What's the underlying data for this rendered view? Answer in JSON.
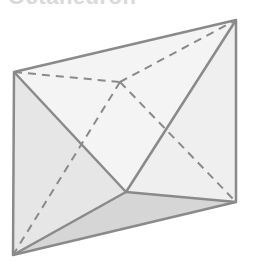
{
  "title": "Octahedron",
  "figure": {
    "shape": "octahedron",
    "vertices": {
      "top_left": [
        14,
        72
      ],
      "top_right": [
        236,
        20
      ],
      "bottom_right": [
        236,
        202
      ],
      "bottom_left": [
        13,
        255
      ],
      "back_hidden": [
        120,
        82
      ],
      "front": [
        126,
        192
      ]
    },
    "colors": {
      "edge": "#8a8a8a",
      "hidden_edge": "#8a8a8a",
      "face_light": "#f4f4f4",
      "face_left": "#e6e6e6",
      "face_bottom": "#d6d6d6",
      "face_right": "#efefef"
    }
  }
}
